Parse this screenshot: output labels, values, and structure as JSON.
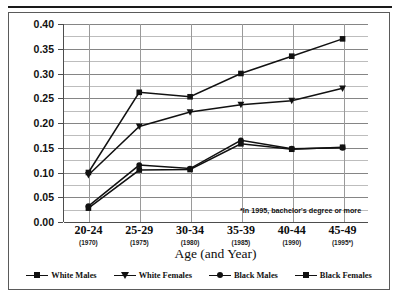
{
  "figure": {
    "xaxis_title": "Age (and Year)",
    "footnote": "*In 1995, bachelor's degree or more"
  },
  "legend": {
    "items": [
      {
        "label": "White Males",
        "marker": "square",
        "color": "#111111"
      },
      {
        "label": "White Females",
        "marker": "triangle",
        "color": "#111111"
      },
      {
        "label": "Black Males",
        "marker": "circle",
        "color": "#111111"
      },
      {
        "label": "Black Females",
        "marker": "square",
        "color": "#111111"
      }
    ]
  },
  "chart_data": {
    "type": "line",
    "title": "",
    "xlabel": "Age (and Year)",
    "ylabel": "",
    "categories": [
      "20-24",
      "25-29",
      "30-34",
      "35-39",
      "40-44",
      "45-49"
    ],
    "category_sublabels": [
      "(1970)",
      "(1975)",
      "(1980)",
      "(1985)",
      "(1990)",
      "(1995*)"
    ],
    "ylim": [
      0.0,
      0.4
    ],
    "yticks": [
      0.0,
      0.05,
      0.1,
      0.15,
      0.2,
      0.25,
      0.3,
      0.35,
      0.4
    ],
    "ytick_labels": [
      "0.00",
      "0.05",
      "0.10",
      "0.15",
      "0.20",
      "0.25",
      "0.30",
      "0.35",
      "0.40"
    ],
    "minor_yticks": [
      0.025,
      0.075,
      0.125,
      0.175,
      0.225,
      0.275,
      0.325,
      0.375
    ],
    "grid": true,
    "legend_position": "bottom",
    "annotations": [
      "*In 1995, bachelor's degree or more"
    ],
    "series": [
      {
        "name": "White Males",
        "marker": "square",
        "values": [
          0.1,
          0.262,
          0.253,
          0.3,
          0.335,
          0.37
        ]
      },
      {
        "name": "White Females",
        "marker": "triangle",
        "values": [
          0.095,
          0.193,
          0.222,
          0.237,
          0.245,
          0.27
        ]
      },
      {
        "name": "Black Males",
        "marker": "circle",
        "values": [
          0.032,
          0.115,
          0.108,
          0.165,
          0.148,
          0.15
        ]
      },
      {
        "name": "Black Females",
        "marker": "square",
        "values": [
          0.028,
          0.105,
          0.106,
          0.158,
          0.147,
          0.151
        ]
      }
    ]
  }
}
